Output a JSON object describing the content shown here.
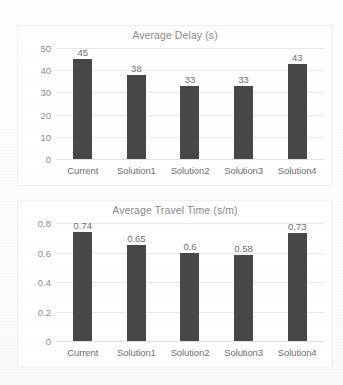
{
  "page": {
    "background_color": "#fdfdfd",
    "bar_color": "#474747",
    "gridline_color": "#e9e9e9",
    "title_color": "#898989",
    "caption_partial": ""
  },
  "chart_data": [
    {
      "type": "bar",
      "name": "average-delay",
      "title": "Average Delay (s)",
      "xlabel": "",
      "ylabel": "",
      "categories": [
        "Current",
        "Solution1",
        "Solution2",
        "Solution3",
        "Solution4"
      ],
      "values": [
        45,
        38,
        33,
        33,
        43
      ],
      "data_labels": [
        "45",
        "38",
        "33",
        "33",
        "43"
      ],
      "yticks": [
        50,
        40,
        30,
        20,
        10,
        0
      ],
      "ytick_labels": [
        "50",
        "40",
        "30",
        "20",
        "10",
        "0"
      ],
      "ylim": [
        0,
        50
      ],
      "grid": true,
      "legend": false,
      "legend_position": "none",
      "bar_color": "#474747"
    },
    {
      "type": "bar",
      "name": "average-travel-time",
      "title": "Average Travel Time (s/m)",
      "xlabel": "",
      "ylabel": "",
      "categories": [
        "Current",
        "Solution1",
        "Solution2",
        "Solution3",
        "Solution4"
      ],
      "values": [
        0.74,
        0.65,
        0.6,
        0.58,
        0.73
      ],
      "data_labels": [
        "0.74",
        "0.65",
        "0.6",
        "0.58",
        "0.73"
      ],
      "yticks": [
        0.8,
        0.6,
        0.4,
        0.2,
        0
      ],
      "ytick_labels": [
        "0.8",
        "0.6",
        "0.4",
        "0.2",
        "0"
      ],
      "ylim": [
        0,
        0.8
      ],
      "grid": true,
      "legend": false,
      "legend_position": "none",
      "bar_color": "#474747"
    }
  ]
}
